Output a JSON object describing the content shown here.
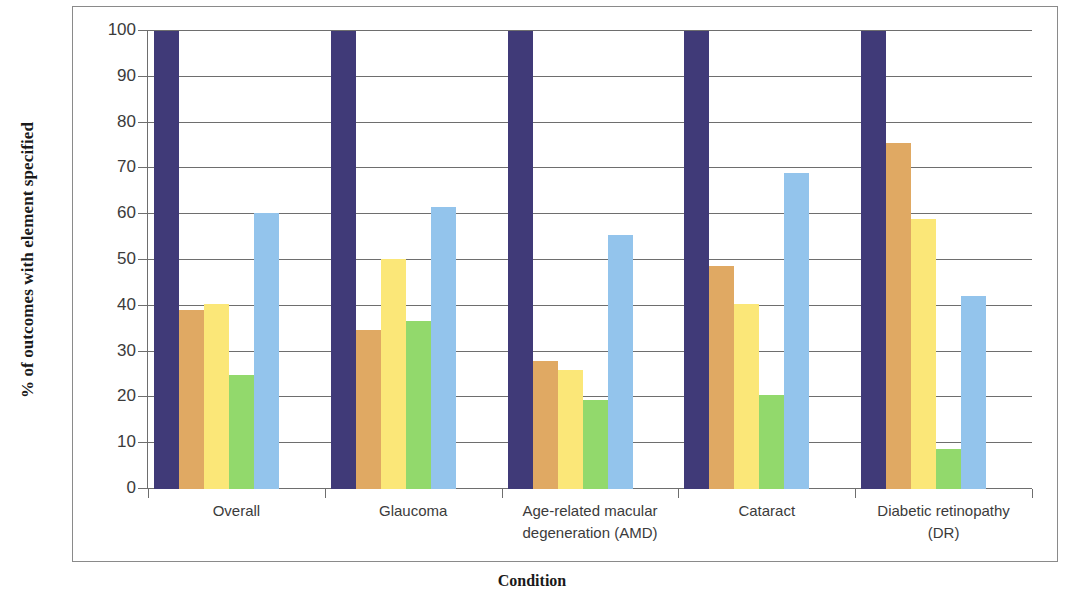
{
  "chart_data": {
    "type": "bar",
    "title": "",
    "xlabel": "Condition",
    "ylabel": "% of outcomes with element specified",
    "categories": [
      "Overall",
      "Glaucoma",
      "Age-related macular degeneration (AMD)",
      "Cataract",
      "Diabetic retinopathy (DR)"
    ],
    "category_lines": [
      [
        "Overall"
      ],
      [
        "Glaucoma"
      ],
      [
        "Age-related macular",
        "degeneration (AMD)"
      ],
      [
        "Cataract"
      ],
      [
        "Diabetic retinopathy",
        "(DR)"
      ]
    ],
    "series": [
      {
        "name": "series-1",
        "color": "#403a78",
        "values": [
          100,
          100,
          100,
          100,
          100
        ]
      },
      {
        "name": "series-2",
        "color": "#e0a963",
        "values": [
          39.0,
          34.8,
          28.0,
          48.8,
          75.5
        ]
      },
      {
        "name": "series-3",
        "color": "#fbe778",
        "values": [
          40.4,
          50.2,
          26.0,
          40.5,
          59.0
        ]
      },
      {
        "name": "series-4",
        "color": "#92d96c",
        "values": [
          24.9,
          36.7,
          19.5,
          20.6,
          8.7
        ]
      },
      {
        "name": "series-5",
        "color": "#93c4ec",
        "values": [
          60.2,
          61.6,
          55.5,
          69.0,
          42.2
        ]
      }
    ],
    "ylim": [
      0,
      100
    ],
    "ytick_labels": [
      "100",
      "90",
      "80",
      "70",
      "60",
      "50",
      "40",
      "30",
      "20",
      "10",
      "0"
    ],
    "ytick_values": [
      100,
      90,
      80,
      70,
      60,
      50,
      40,
      30,
      20,
      10,
      0
    ],
    "grid": true,
    "legend": "none",
    "plot_border_color": "#8a8a8a",
    "gridline_color": "#6e6e6e"
  }
}
